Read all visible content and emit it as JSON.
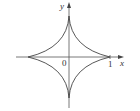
{
  "figure": {
    "type": "astroid",
    "equation": "x^(2/3) + y^(2/3) = 1",
    "axes": {
      "x_label": "x",
      "y_label": "y",
      "origin_label": "0",
      "x_tick_label": "1"
    },
    "colors": {
      "curve": "#444444",
      "axes": "#555555",
      "text": "#333333"
    }
  }
}
